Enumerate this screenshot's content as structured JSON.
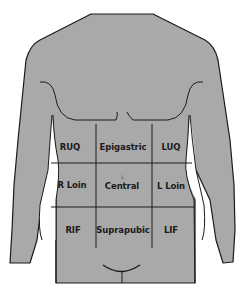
{
  "diagram": {
    "colors": {
      "body_fill": "#a9a9a9",
      "outline": "#1a1a1a",
      "background": "#ffffff",
      "label": "#1a1a1a"
    },
    "regions": [
      {
        "id": "ruq",
        "label": "RUQ",
        "x": 70,
        "y": 147
      },
      {
        "id": "epigastric",
        "label": "Epigastric",
        "x": 123,
        "y": 147
      },
      {
        "id": "luq",
        "label": "LUQ",
        "x": 171,
        "y": 147
      },
      {
        "id": "r-loin",
        "label": "R Loin",
        "x": 72,
        "y": 185
      },
      {
        "id": "central",
        "label": "Central",
        "x": 122,
        "y": 186
      },
      {
        "id": "l-loin",
        "label": "L Loin",
        "x": 171,
        "y": 186
      },
      {
        "id": "rif",
        "label": "RIF",
        "x": 73,
        "y": 230
      },
      {
        "id": "suprapubic",
        "label": "Suprapubic",
        "x": 123,
        "y": 230
      },
      {
        "id": "lif",
        "label": "LIF",
        "x": 171,
        "y": 230
      }
    ],
    "umbilicus_mark": "└"
  }
}
